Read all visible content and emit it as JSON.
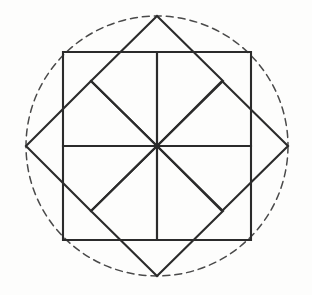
{
  "figure": {
    "title": "Pinwheel rosette of eight overlapping squares inscribed in a dashed circle",
    "kind": "geometric-line-drawing",
    "background_color": "#fdfdfc",
    "line_color": "#2b2b2b",
    "dash_color": "#4a4a4a",
    "solid_stroke_width": 2.1,
    "dashed_stroke_width": 1.5,
    "dash_pattern": "7 5",
    "canvas": {
      "width": 312,
      "height": 295
    },
    "center": {
      "x": 157,
      "y": 146
    },
    "circle": {
      "cx": 157,
      "cy": 146,
      "rx": 131,
      "ry": 130
    },
    "square_count": 8,
    "axis_aligned_square_count": 4,
    "rotated_square_count": 4,
    "half_side": 94,
    "diagonal_half_diagonal": 131,
    "labels": {
      "circle_name": "circumscribing-dashed-circle",
      "center_name": "center-point",
      "upright_group": "axis-aligned-squares",
      "rotated_group": "rotated-squares"
    },
    "shapes": {
      "upright_squares": [
        {
          "name": "square-upper-left",
          "points": "63,52 157,52 157,146 63,146"
        },
        {
          "name": "square-upper-right",
          "points": "157,52 251,52 251,146 157,146"
        },
        {
          "name": "square-lower-right",
          "points": "157,146 251,146 251,240 157,240"
        },
        {
          "name": "square-lower-left",
          "points": "63,146 157,146 157,240 63,240"
        }
      ],
      "rotated_squares": [
        {
          "name": "square-rotated-top",
          "points": "157,16 223,81 157,146 91,81"
        },
        {
          "name": "square-rotated-right",
          "points": "222,81 288,146 222,211 157,146"
        },
        {
          "name": "square-rotated-bottom",
          "points": "157,146 223,211 157,276 91,211"
        },
        {
          "name": "square-rotated-left",
          "points": "91,81 157,146 91,211 26,146"
        }
      ]
    }
  }
}
